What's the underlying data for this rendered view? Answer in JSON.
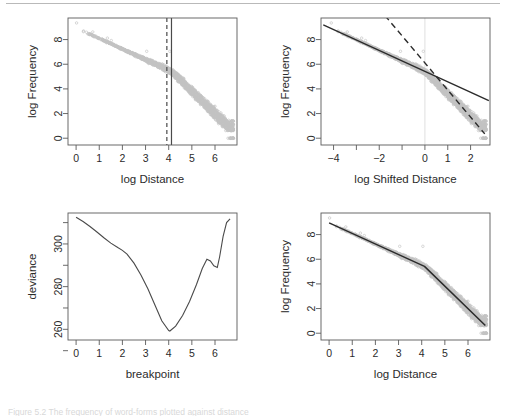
{
  "figure": {
    "caption_hidden": "Figure 5.2 The frequency of word-forms plotted against distance",
    "background": "#ffffff",
    "rule_color": "#b9b9b9"
  },
  "chart_data": [
    {
      "id": "panel-top-left",
      "type": "scatter",
      "title": "",
      "xlabel": "log Distance",
      "ylabel": "log Frequency",
      "xlim": [
        -0.35,
        6.95
      ],
      "ylim": [
        -0.55,
        9.75
      ],
      "xticks": [
        0,
        1,
        2,
        3,
        4,
        5,
        6
      ],
      "xticklabels": [
        "0",
        "1",
        "2",
        "3",
        "4",
        "5",
        "6"
      ],
      "yticks": [
        0,
        2,
        4,
        6,
        8
      ],
      "yticklabels": [
        "0",
        "2",
        "4",
        "6",
        "8"
      ],
      "grid": false,
      "point_color": "#c2c2c2",
      "annotations": [
        {
          "name": "dashed-breakpoint-line",
          "type": "vline",
          "x": 3.92,
          "style": "dashed"
        },
        {
          "name": "solid-breakpoint-line",
          "type": "vline",
          "x": 4.12,
          "style": "solid"
        }
      ]
    },
    {
      "id": "panel-top-right",
      "type": "scatter",
      "title": "",
      "xlabel": "log Shifted Distance",
      "ylabel": "log Frequency",
      "xlim": [
        -4.55,
        2.85
      ],
      "ylim": [
        -0.55,
        9.75
      ],
      "xticks": [
        -4,
        -3,
        -2,
        -1,
        0,
        1,
        2
      ],
      "xticklabels": [
        "−4",
        "",
        "−2",
        "",
        "0",
        "1",
        "2"
      ],
      "yticks": [
        0,
        2,
        4,
        6,
        8
      ],
      "yticklabels": [
        "0",
        "2",
        "4",
        "6",
        "8"
      ],
      "grid": false,
      "point_color": "#c2c2c2",
      "series": [
        {
          "name": "shallow-regression-solid",
          "style": "solid",
          "x": [
            -4.45,
            2.8
          ],
          "y": [
            9.2,
            3.05
          ]
        },
        {
          "name": "steep-regression-dashed",
          "style": "dashed",
          "x": [
            -1.75,
            2.62
          ],
          "y": [
            9.95,
            0.35
          ]
        }
      ],
      "annotations": [
        {
          "name": "origin-reference-line",
          "type": "vline",
          "x": 0.0,
          "style": "faint"
        }
      ]
    },
    {
      "id": "panel-bottom-left",
      "type": "line",
      "title": "",
      "xlabel": "breakpoint",
      "ylabel": "deviance",
      "xlim": [
        -0.35,
        6.95
      ],
      "ylim": [
        255.0,
        314.5
      ],
      "xticks": [
        0,
        1,
        2,
        3,
        4,
        5,
        6
      ],
      "xticklabels": [
        "0",
        "1",
        "2",
        "3",
        "4",
        "5",
        "6"
      ],
      "yticks": [
        250,
        260,
        270,
        280,
        290,
        300,
        310
      ],
      "yticklabels": [
        "",
        "260",
        "",
        "280",
        "",
        "300",
        ""
      ],
      "grid": false,
      "x": [
        0.0,
        0.3,
        0.6,
        0.9,
        1.2,
        1.5,
        1.8,
        2.0,
        2.2,
        2.5,
        2.8,
        3.1,
        3.4,
        3.7,
        4.0,
        4.05,
        4.3,
        4.6,
        4.9,
        5.2,
        5.45,
        5.65,
        5.8,
        5.95,
        6.1,
        6.2,
        6.35,
        6.5,
        6.65
      ],
      "y": [
        312.5,
        310.5,
        308.2,
        305.6,
        302.9,
        300.4,
        298.3,
        297.0,
        295.2,
        291.0,
        285.5,
        279.0,
        271.5,
        264.0,
        259.4,
        259.2,
        261.5,
        266.5,
        273.0,
        281.0,
        288.5,
        292.8,
        292.0,
        289.8,
        289.0,
        294.0,
        303.5,
        310.0,
        311.8
      ],
      "minimum": {
        "x": 4.05,
        "y": 259.2
      },
      "local_max": {
        "x": 5.65,
        "y": 292.8
      }
    },
    {
      "id": "panel-bottom-right",
      "type": "scatter",
      "title": "",
      "xlabel": "log Distance",
      "ylabel": "log Frequency",
      "xlim": [
        -0.35,
        6.95
      ],
      "ylim": [
        -0.55,
        9.75
      ],
      "xticks": [
        0,
        1,
        2,
        3,
        4,
        5,
        6
      ],
      "xticklabels": [
        "0",
        "1",
        "2",
        "3",
        "4",
        "5",
        "6"
      ],
      "yticks": [
        0,
        2,
        4,
        6,
        8
      ],
      "yticklabels": [
        "0",
        "2",
        "4",
        "6",
        "8"
      ],
      "grid": false,
      "point_color": "#c2c2c2",
      "series": [
        {
          "name": "piecewise-broken-stick-fit",
          "style": "solid",
          "breakpoint_x": 4.12,
          "x": [
            0.0,
            4.12,
            6.75
          ],
          "y": [
            8.95,
            5.42,
            0.62
          ]
        }
      ]
    }
  ]
}
